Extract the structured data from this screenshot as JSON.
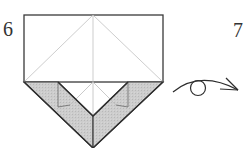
{
  "diagram": {
    "type": "origami-instruction",
    "steps": [
      {
        "number": "6",
        "description": "Folded model with top rectangle, crease lines, and gray flaps forming a V/pentagon shape"
      },
      {
        "number": "7",
        "description": ""
      }
    ],
    "symbols": [
      {
        "name": "turn-over-arrow",
        "meaning": "Turn the model over"
      }
    ],
    "colors": {
      "outline": "#3a3a3a",
      "crease": "#bbbbbb",
      "paper_front": "#ffffff",
      "paper_back": "#c8c8c8"
    }
  }
}
